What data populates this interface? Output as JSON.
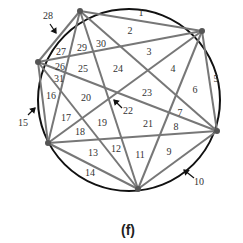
{
  "figure": {
    "caption": "(f)",
    "colors": {
      "circle": "#111111",
      "chord": "#777777",
      "vertex": "#555555",
      "text": "#333333"
    },
    "vertices": [
      "A",
      "B",
      "C",
      "D",
      "E",
      "F"
    ],
    "chords": [
      [
        "A",
        "B"
      ],
      [
        "A",
        "C"
      ],
      [
        "A",
        "D"
      ],
      [
        "A",
        "E"
      ],
      [
        "A",
        "F"
      ],
      [
        "B",
        "C"
      ],
      [
        "B",
        "D"
      ],
      [
        "B",
        "E"
      ],
      [
        "B",
        "F"
      ],
      [
        "C",
        "D"
      ],
      [
        "C",
        "E"
      ],
      [
        "C",
        "F"
      ],
      [
        "D",
        "E"
      ],
      [
        "D",
        "F"
      ],
      [
        "E",
        "F"
      ]
    ],
    "region_labels": [
      "1",
      "2",
      "3",
      "4",
      "5",
      "6",
      "7",
      "8",
      "9",
      "10",
      "11",
      "12",
      "13",
      "14",
      "15",
      "16",
      "17",
      "18",
      "19",
      "20",
      "21",
      "22",
      "23",
      "24",
      "25",
      "26",
      "27",
      "28",
      "29",
      "30",
      "31"
    ],
    "arrow_labels": [
      "28",
      "15",
      "10",
      "22"
    ]
  }
}
